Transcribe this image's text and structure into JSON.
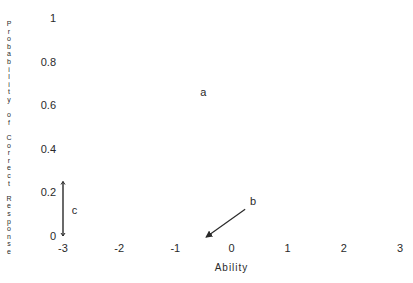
{
  "chart_data": {
    "type": "line",
    "title": "",
    "xlabel": "Ability",
    "ylabel": "Probability of Correct Response",
    "xlim": [
      -3,
      3
    ],
    "ylim": [
      0,
      1
    ],
    "x_ticks": [
      -3,
      -2,
      -1,
      0,
      1,
      2,
      3
    ],
    "x_tick_labels": [
      "-3",
      "-2",
      "-1",
      "0",
      "1",
      "2",
      "3"
    ],
    "y_ticks": [
      0,
      0.2,
      0.4,
      0.6,
      0.8,
      1
    ],
    "y_tick_labels": [
      "0",
      "0.2",
      "0.4",
      "0.6",
      "0.8",
      "1"
    ],
    "grid": false,
    "series": [],
    "annotations": [
      {
        "label": "a",
        "x": -0.5,
        "y": 0.66,
        "kind": "text"
      },
      {
        "label": "b",
        "x": 0.35,
        "y": 0.15,
        "kind": "arrow",
        "arrow_to": [
          -0.45,
          0.0
        ]
      },
      {
        "label": "c",
        "x": -2.85,
        "y": 0.12,
        "kind": "range",
        "range_x": -3,
        "range_y": [
          0,
          0.25
        ]
      }
    ]
  }
}
